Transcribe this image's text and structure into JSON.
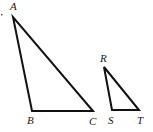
{
  "diagram": {
    "type": "similar-triangles",
    "triangles": [
      {
        "name": "ABC",
        "vertices": [
          {
            "label": "A",
            "x": 13,
            "y": 17
          },
          {
            "label": "B",
            "x": 32,
            "y": 111
          },
          {
            "label": "C",
            "x": 93,
            "y": 111
          }
        ]
      },
      {
        "name": "RST",
        "vertices": [
          {
            "label": "R",
            "x": 104,
            "y": 67
          },
          {
            "label": "S",
            "x": 112,
            "y": 110
          },
          {
            "label": "T",
            "x": 139,
            "y": 110
          }
        ]
      }
    ],
    "labels": {
      "A": "A",
      "B": "B",
      "C": "C",
      "R": "R",
      "S": "S",
      "T": "T"
    },
    "line_color": "#111111"
  }
}
